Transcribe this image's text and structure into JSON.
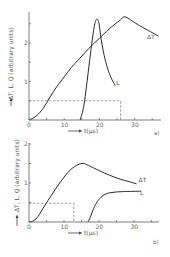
{
  "chart_data": [
    {
      "type": "line",
      "panel_label": "a)",
      "xlabel": "t(µs)",
      "ylabel": "ΔT, L, Q (arbitrary units)",
      "xlim": [
        0,
        36
      ],
      "ylim": [
        0,
        2.7
      ],
      "xticks": [
        0,
        10,
        20,
        30
      ],
      "yticks": [
        1,
        2
      ],
      "grid": false,
      "series": [
        {
          "name": "ΔT",
          "points": [
            [
              0,
              0
            ],
            [
              2,
              0.1
            ],
            [
              4,
              0.3
            ],
            [
              6,
              0.6
            ],
            [
              8,
              0.88
            ],
            [
              10,
              1.12
            ],
            [
              12,
              1.36
            ],
            [
              14,
              1.56
            ],
            [
              16,
              1.76
            ],
            [
              18,
              1.95
            ],
            [
              20,
              2.12
            ],
            [
              22,
              2.3
            ],
            [
              24,
              2.46
            ],
            [
              26,
              2.6
            ],
            [
              27.3,
              2.68
            ],
            [
              30,
              2.53
            ],
            [
              33,
              2.37
            ],
            [
              36.8,
              2.18
            ]
          ]
        },
        {
          "name": "L",
          "points": [
            [
              14.5,
              0
            ],
            [
              15.2,
              0.2
            ],
            [
              15.8,
              0.5
            ],
            [
              16.5,
              1.0
            ],
            [
              17.3,
              1.6
            ],
            [
              18,
              2.1
            ],
            [
              18.7,
              2.5
            ],
            [
              19.3,
              2.62
            ],
            [
              19.9,
              2.5
            ],
            [
              20.5,
              2.1
            ],
            [
              21.3,
              1.7
            ],
            [
              22.3,
              1.35
            ],
            [
              23.3,
              1.1
            ],
            [
              24.5,
              0.89
            ]
          ]
        },
        {
          "name": "Q",
          "style": "dashed",
          "points": [
            [
              0,
              0.5
            ],
            [
              26,
              0.5
            ],
            [
              26,
              0
            ]
          ]
        }
      ],
      "annotations": [
        {
          "text": "ΔT",
          "x": 33.5,
          "y": 2.1
        },
        {
          "text": "L",
          "x": 24.8,
          "y": 0.92
        }
      ]
    },
    {
      "type": "line",
      "panel_label": "b)",
      "xlabel": "t(µs)",
      "ylabel": "ΔT, L, Q (arbitrary units)",
      "xlim": [
        0,
        36
      ],
      "ylim": [
        0,
        2.0
      ],
      "xticks": [
        0,
        10,
        20,
        30
      ],
      "yticks": [
        1,
        2
      ],
      "grid": false,
      "series": [
        {
          "name": "ΔT",
          "points": [
            [
              0,
              0
            ],
            [
              1,
              0.02
            ],
            [
              2,
              0.08
            ],
            [
              3,
              0.2
            ],
            [
              4,
              0.35
            ],
            [
              6,
              0.63
            ],
            [
              8,
              0.9
            ],
            [
              10,
              1.15
            ],
            [
              12,
              1.35
            ],
            [
              14,
              1.47
            ],
            [
              15.5,
              1.5
            ],
            [
              17,
              1.45
            ],
            [
              20,
              1.32
            ],
            [
              23,
              1.2
            ],
            [
              26,
              1.1
            ],
            [
              28,
              1.05
            ],
            [
              30.7,
              0.98
            ]
          ]
        },
        {
          "name": "L",
          "points": [
            [
              16.8,
              0
            ],
            [
              17.5,
              0.12
            ],
            [
              18.5,
              0.35
            ],
            [
              19.5,
              0.52
            ],
            [
              20.5,
              0.63
            ],
            [
              22,
              0.72
            ],
            [
              24,
              0.76
            ],
            [
              27,
              0.78
            ],
            [
              32,
              0.79
            ]
          ]
        },
        {
          "name": "Q",
          "style": "dashed",
          "points": [
            [
              0,
              0.48
            ],
            [
              12.8,
              0.48
            ],
            [
              12.8,
              0
            ]
          ]
        }
      ],
      "annotations": [
        {
          "text": "ΔT",
          "x": 31.3,
          "y": 1.02
        },
        {
          "text": "L",
          "x": 31.7,
          "y": 0.7
        }
      ]
    }
  ],
  "panels": [
    {
      "label": "a)",
      "xlabel": "t(µs)",
      "ylabel": "ΔT, L, Q (arbitrary units)"
    },
    {
      "label": "b)",
      "xlabel": "t(µs)",
      "ylabel": "ΔT, L, Q (arbitrary units)"
    }
  ]
}
